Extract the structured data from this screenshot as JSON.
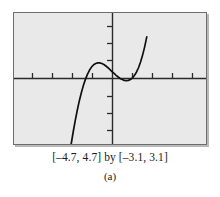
{
  "figure": {
    "caption_range": "[–4.7, 4.7] by [–3.1, 3.1]",
    "panel_label": "(a)",
    "screen": {
      "background_color": "#e9e9e9",
      "border_color": "#6e6e6e",
      "shadow_color": "#b9b9b9",
      "axis_color": "#2a2a2a",
      "curve_color": "#111111"
    }
  },
  "chart_data": {
    "type": "line",
    "title": "",
    "subtitle": "",
    "xlabel": "",
    "ylabel": "",
    "xlim": [
      -4.7,
      4.7
    ],
    "ylim": [
      -3.1,
      3.1
    ],
    "grid": false,
    "legend": "none",
    "xticks": [
      -4,
      -3,
      -2,
      -1,
      1,
      2,
      3,
      4
    ],
    "yticks": [
      -3,
      -2,
      -1,
      1,
      2,
      3
    ],
    "xtick_labels": [],
    "ytick_labels": [],
    "annotations": [],
    "series": [
      {
        "name": "cubic curve",
        "x": [
          -1.9,
          -1.8,
          -1.7,
          -1.6,
          -1.5,
          -1.4,
          -1.3,
          -1.2,
          -1.1,
          -1.0,
          -0.9,
          -0.8,
          -0.7,
          -0.6,
          -0.5,
          -0.4,
          -0.3,
          -0.2,
          -0.1,
          0.0,
          0.1,
          0.2,
          0.3,
          0.4,
          0.5,
          0.6,
          0.7,
          0.8,
          0.9,
          1.0,
          1.1,
          1.2,
          1.3,
          1.4,
          1.5,
          1.6,
          1.7,
          1.8
        ],
        "y": [
          -3.1,
          -2.52,
          -1.98,
          -1.49,
          -1.05,
          -0.66,
          -0.32,
          -0.03,
          0.21,
          0.4,
          0.55,
          0.65,
          0.71,
          0.74,
          0.74,
          0.71,
          0.66,
          0.59,
          0.51,
          0.42,
          0.33,
          0.24,
          0.15,
          0.07,
          0.0,
          -0.05,
          -0.09,
          -0.1,
          -0.09,
          -0.05,
          0.03,
          0.15,
          0.31,
          0.52,
          0.79,
          1.12,
          1.51,
          1.97
        ]
      }
    ]
  }
}
